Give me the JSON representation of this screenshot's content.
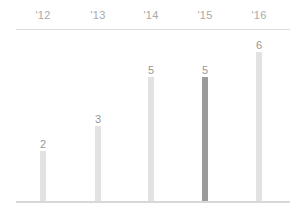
{
  "chart_data": {
    "type": "bar",
    "title": "",
    "subtitle": "",
    "xlabel": "",
    "ylabel": "",
    "categories": [
      "'12",
      "'13",
      "'14",
      "'15",
      "'16"
    ],
    "values": [
      2,
      3,
      5,
      5,
      6
    ],
    "value_labels": [
      "2",
      "3",
      "5",
      "5",
      "6"
    ],
    "ylim": [
      0,
      6
    ],
    "grid": false,
    "legend": null,
    "legend_position": "none",
    "axis_labels_position": "top",
    "highlighted_index": 3,
    "colors": {
      "bar": "#e2e2e2",
      "bar_highlight": "#9b9b9b",
      "value_label": "#989898",
      "category_label": "#a9a9a9",
      "rule": "#dedede",
      "baseline": "#d8d8d8",
      "background": "#ffffff"
    }
  },
  "bars": [
    {
      "category": "'12",
      "value": 2,
      "label": "2",
      "highlight": false
    },
    {
      "category": "'13",
      "value": 3,
      "label": "3",
      "highlight": false
    },
    {
      "category": "'14",
      "value": 5,
      "label": "5",
      "highlight": false
    },
    {
      "category": "'15",
      "value": 5,
      "label": "5",
      "highlight": true
    },
    {
      "category": "'16",
      "value": 6,
      "label": "6",
      "highlight": false
    }
  ]
}
